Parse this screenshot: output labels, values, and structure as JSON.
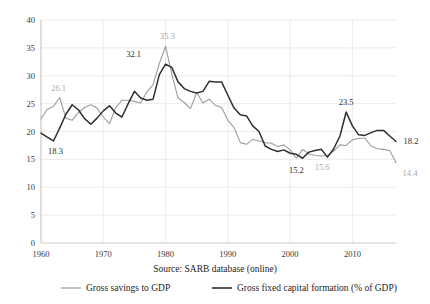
{
  "chart_data": {
    "type": "line",
    "title": "",
    "subtitle": "",
    "xlabel": "",
    "ylabel": "",
    "source": "Source: SARB database (online)",
    "xlim": [
      1960,
      2017
    ],
    "ylim": [
      0,
      40
    ],
    "yticks": [
      0,
      5,
      10,
      15,
      20,
      25,
      30,
      35,
      40
    ],
    "xticks": [
      1960,
      1970,
      1980,
      1990,
      2000,
      2010
    ],
    "grid": true,
    "legend_position": "bottom",
    "x": [
      1960,
      1961,
      1962,
      1963,
      1964,
      1965,
      1966,
      1967,
      1968,
      1969,
      1970,
      1971,
      1972,
      1973,
      1974,
      1975,
      1976,
      1977,
      1978,
      1979,
      1980,
      1981,
      1982,
      1983,
      1984,
      1985,
      1986,
      1987,
      1988,
      1989,
      1990,
      1991,
      1992,
      1993,
      1994,
      1995,
      1996,
      1997,
      1998,
      1999,
      2000,
      2001,
      2002,
      2003,
      2004,
      2005,
      2006,
      2007,
      2008,
      2009,
      2010,
      2011,
      2012,
      2013,
      2014,
      2015,
      2016,
      2017
    ],
    "series": [
      {
        "name": "Gross savings to GDP",
        "color": "#9d9d9d",
        "values": [
          22.3,
          24.0,
          24.5,
          26.1,
          22.4,
          22.0,
          23.4,
          24.3,
          24.8,
          24.2,
          22.6,
          21.4,
          24.3,
          25.6,
          25.6,
          25.4,
          25.1,
          27.1,
          28.4,
          32.2,
          35.3,
          30.3,
          26.0,
          25.2,
          24.1,
          27.0,
          25.1,
          25.8,
          24.7,
          24.3,
          22.0,
          20.7,
          18.0,
          17.7,
          18.6,
          18.3,
          18.0,
          17.9,
          17.3,
          17.6,
          16.7,
          15.2,
          16.8,
          16.0,
          15.7,
          15.6,
          15.7,
          16.5,
          17.6,
          17.5,
          18.5,
          18.8,
          18.8,
          17.4,
          16.9,
          16.8,
          16.6,
          14.4
        ]
      },
      {
        "name": "Gross fixed capital formation (% of GDP)",
        "color": "#2f2f2f",
        "values": [
          19.7,
          19.0,
          18.3,
          20.6,
          23.1,
          24.8,
          23.9,
          22.3,
          21.3,
          22.4,
          23.7,
          24.6,
          23.3,
          22.6,
          25.0,
          27.2,
          26.0,
          25.6,
          25.8,
          30.2,
          32.1,
          31.5,
          28.9,
          27.7,
          27.2,
          26.9,
          27.2,
          29.0,
          28.9,
          28.9,
          26.5,
          24.2,
          23.0,
          22.8,
          21.0,
          20.0,
          17.4,
          16.8,
          16.4,
          16.7,
          16.1,
          15.9,
          15.2,
          16.3,
          16.6,
          16.8,
          15.4,
          16.9,
          19.2,
          23.5,
          21.0,
          19.4,
          19.3,
          19.8,
          20.2,
          20.2,
          19.2,
          18.2
        ]
      }
    ],
    "annotations": [
      {
        "text": "18.3",
        "series": "Gross fixed capital formation (% of GDP)",
        "x": 1962,
        "y": 18.3,
        "color": "dark"
      },
      {
        "text": "26.1",
        "series": "Gross savings to GDP",
        "x": 1963,
        "y": 26.1,
        "color": "light"
      },
      {
        "text": "32.1",
        "series": "Gross fixed capital formation (% of GDP)",
        "x": 1976,
        "y": 32.1,
        "color": "dark"
      },
      {
        "text": "35.3",
        "series": "Gross savings to GDP",
        "x": 1980,
        "y": 35.3,
        "color": "light"
      },
      {
        "text": "15.2",
        "series": "Gross savings to GDP",
        "x": 2001,
        "y": 15.2,
        "color": "dark"
      },
      {
        "text": "15.6",
        "series": "Gross savings to GDP",
        "x": 2005,
        "y": 15.6,
        "color": "light"
      },
      {
        "text": "23.5",
        "series": "Gross fixed capital formation (% of GDP)",
        "x": 2009,
        "y": 23.5,
        "color": "dark"
      },
      {
        "text": "18.2",
        "series": "Gross fixed capital formation (% of GDP)",
        "x": 2017,
        "y": 18.2,
        "color": "dark"
      },
      {
        "text": "14.4",
        "series": "Gross savings to GDP",
        "x": 2017,
        "y": 14.4,
        "color": "light"
      }
    ],
    "legend": [
      {
        "label": "Gross savings to GDP",
        "color": "#9d9d9d"
      },
      {
        "label": "Gross fixed capital formation (% of GDP)",
        "color": "#2f2f2f"
      }
    ]
  }
}
